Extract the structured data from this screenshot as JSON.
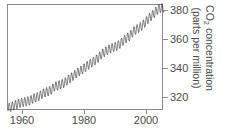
{
  "chart_data": {
    "type": "line",
    "title": "",
    "subtitle": "",
    "xlabel": "",
    "ylabel_line1": "CO2 concentration",
    "ylabel_line2": "(parts per million)",
    "ylabel_prefix": "CO",
    "ylabel_sub": "2",
    "ylabel_suffix": " concentration",
    "xlim": [
      1958,
      2008
    ],
    "ylim": [
      313,
      385
    ],
    "xticks": [
      1960,
      1980,
      2000
    ],
    "xtick_labels": [
      "1960",
      "1980",
      "2000"
    ],
    "yticks": [
      320,
      340,
      360,
      380
    ],
    "ytick_labels": [
      "320",
      "340",
      "360",
      "380"
    ],
    "y_axis_side": "right",
    "grid": false,
    "legend": "none",
    "line_color": "#1a1a1a",
    "axis_color": "#8a8a8a",
    "text_color": "#4a4a4a",
    "background": "#ffffff",
    "series": [
      {
        "name": "Mauna Loa monthly mean CO2",
        "description": "Keeling Curve: monthly mean atmospheric CO2 showing rising trend with annual seasonal sawtooth oscillation of about 6 ppm peak-to-peak",
        "seasonal_amplitude_ppm": 3.1,
        "x": [
          1958,
          1959,
          1960,
          1961,
          1962,
          1963,
          1964,
          1965,
          1966,
          1967,
          1968,
          1969,
          1970,
          1971,
          1972,
          1973,
          1974,
          1975,
          1976,
          1977,
          1978,
          1979,
          1980,
          1981,
          1982,
          1983,
          1984,
          1985,
          1986,
          1987,
          1988,
          1989,
          1990,
          1991,
          1992,
          1993,
          1994,
          1995,
          1996,
          1997,
          1998,
          1999,
          2000,
          2001,
          2002,
          2003,
          2004,
          2005,
          2006,
          2007
        ],
        "values": [
          315.0,
          315.8,
          316.9,
          317.6,
          318.5,
          319.0,
          319.6,
          320.0,
          321.4,
          322.2,
          323.0,
          324.6,
          325.7,
          326.3,
          327.5,
          329.7,
          330.2,
          331.1,
          332.0,
          333.8,
          335.4,
          336.8,
          338.7,
          340.1,
          341.4,
          343.0,
          344.6,
          346.0,
          347.4,
          349.2,
          351.6,
          353.1,
          354.4,
          355.6,
          356.4,
          357.1,
          358.8,
          360.8,
          362.6,
          363.7,
          366.6,
          368.3,
          369.5,
          371.0,
          373.2,
          375.8,
          377.5,
          379.8,
          381.9,
          383.0
        ]
      }
    ]
  }
}
